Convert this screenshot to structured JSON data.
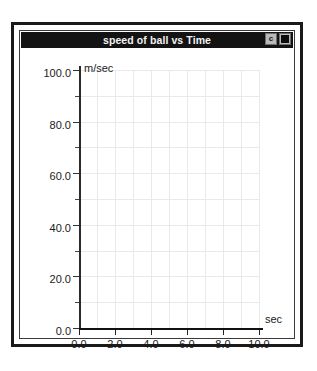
{
  "window": {
    "title": "speed of ball  vs Time",
    "buttons": [
      {
        "name": "zoom-button",
        "glyph": "c"
      },
      {
        "name": "close-button",
        "glyph": "square"
      }
    ]
  },
  "chart_data": {
    "type": "line",
    "title": "speed of ball  vs Time",
    "xlabel": "sec",
    "ylabel": "m/sec",
    "xlim": [
      0.0,
      10.0
    ],
    "ylim": [
      0.0,
      100.0
    ],
    "x_ticks": [
      "0.0",
      "2.0",
      "4.0",
      "6.0",
      "8.0",
      "10.0"
    ],
    "x_tick_values": [
      0.0,
      2.0,
      4.0,
      6.0,
      8.0,
      10.0
    ],
    "x_minor_step": 1.0,
    "y_ticks": [
      "0.0",
      "20.0",
      "40.0",
      "60.0",
      "80.0",
      "100.0"
    ],
    "y_tick_values": [
      0.0,
      20.0,
      40.0,
      60.0,
      80.0,
      100.0
    ],
    "y_minor_step": 10.0,
    "grid": true,
    "grid_color": "#e9e9e9",
    "legend": null,
    "series": [
      {
        "name": "speed of ball",
        "x": [],
        "values": []
      }
    ],
    "annotations": [],
    "note": "empty plot - axes and grid only, no data plotted"
  },
  "colors": {
    "titlebar_bg": "#131313",
    "titlebar_text": "#f2f2f2",
    "frame_border": "#1a1a1a",
    "axis": "#111111",
    "grid": "#e9e9e9",
    "plot_bg": "#ffffff"
  }
}
